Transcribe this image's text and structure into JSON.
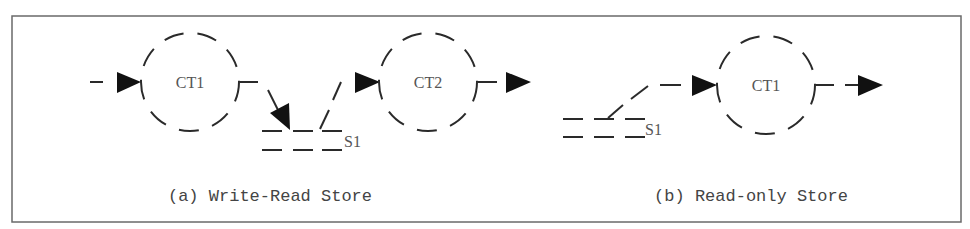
{
  "figure": {
    "border_color": "#6a6a6a",
    "line_color": "#2a2a2a",
    "text_color": "#555555"
  },
  "panel_a": {
    "caption": "(a) Write-Read Store",
    "nodes": [
      {
        "id": "ct1",
        "label": "CT1",
        "shape": "dashed-circle"
      },
      {
        "id": "ct2",
        "label": "CT2",
        "shape": "dashed-circle"
      }
    ],
    "store": {
      "label": "S1",
      "shape": "dashed-parallel-lines"
    },
    "edges": [
      {
        "from": "input",
        "to": "CT1"
      },
      {
        "from": "CT1",
        "to": "S1",
        "label": "write"
      },
      {
        "from": "S1",
        "to": "CT2",
        "label": "read"
      },
      {
        "from": "CT2",
        "to": "output"
      }
    ]
  },
  "panel_b": {
    "caption": "(b) Read-only Store",
    "nodes": [
      {
        "id": "ct1",
        "label": "CT1",
        "shape": "dashed-circle"
      }
    ],
    "store": {
      "label": "S1",
      "shape": "dashed-parallel-lines"
    },
    "edges": [
      {
        "from": "S1",
        "to": "CT1",
        "label": "read"
      },
      {
        "from": "CT1",
        "to": "output"
      }
    ]
  }
}
